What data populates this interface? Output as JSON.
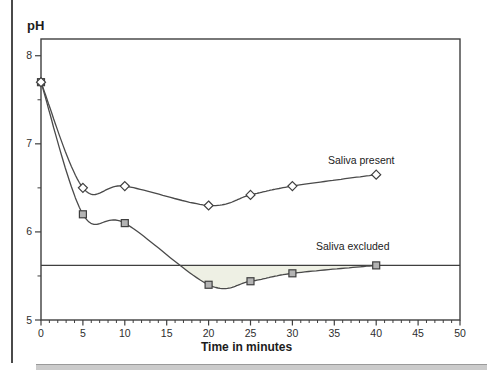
{
  "chart_data": {
    "type": "line",
    "ylabel": "pH",
    "xlabel": "Time in minutes",
    "xlim": [
      0,
      50
    ],
    "ylim": [
      5,
      8.19
    ],
    "x_major_ticks": [
      0,
      5,
      10,
      15,
      20,
      25,
      30,
      35,
      40,
      45,
      50
    ],
    "x_minor_tick_step": 1,
    "y_major_ticks": [
      5,
      6,
      7,
      8
    ],
    "y_minor_ticks": [
      5.5,
      6.5,
      7.5
    ],
    "grid": false,
    "legend_position": "inline-annotations",
    "reference_line": {
      "y": 5.62
    },
    "shaded_region": {
      "between": "reference_line and Saliva excluded curve",
      "x_range": [
        16.8,
        40
      ],
      "color": "#eef0e4"
    },
    "series": [
      {
        "name": "Saliva present",
        "marker": "diamond",
        "marker_fill": "#ffffff",
        "x": [
          0,
          5,
          10,
          20,
          25,
          30,
          40
        ],
        "y": [
          7.7,
          6.5,
          6.52,
          6.3,
          6.42,
          6.52,
          6.65
        ]
      },
      {
        "name": "Saliva excluded",
        "marker": "square",
        "marker_fill": "#b3b3b3",
        "x": [
          0,
          5,
          10,
          20,
          25,
          30,
          40
        ],
        "y": [
          7.7,
          6.2,
          6.1,
          5.4,
          5.44,
          5.53,
          5.62
        ]
      }
    ],
    "colors": {
      "line": "#4a4a4a",
      "axis": "#3f3f3f",
      "tick_label": "#2e2e2e"
    }
  }
}
